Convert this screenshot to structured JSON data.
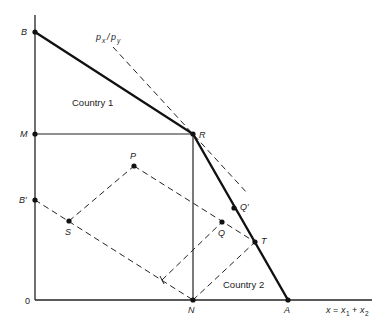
{
  "diagram": {
    "type": "production-possibility-frontier",
    "axes": {
      "origin_label": "0",
      "x_label": "x = x1 + x2",
      "x_label_parts": {
        "x": "x",
        "eq": "=",
        "x1": "x",
        "x1_sub": "1",
        "plus": "+",
        "x2": "x",
        "x2_sub": "2"
      }
    },
    "price_line_label": {
      "p": "p",
      "x_sub": "x",
      "slash": "/",
      "p2": "p",
      "y_sub": "y"
    },
    "regions": {
      "country1": "Country 1",
      "country2": "Country 2"
    },
    "points": {
      "B": "B",
      "M": "M",
      "B_prime": "B′",
      "R": "R",
      "N": "N",
      "A": "A",
      "P": "P",
      "S": "S",
      "Q": "Q",
      "Q_prime": "Q′",
      "T": "T"
    }
  }
}
